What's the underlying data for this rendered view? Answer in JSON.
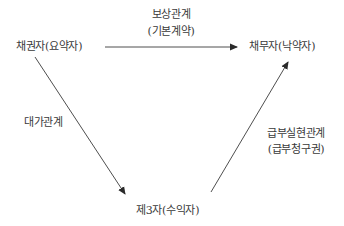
{
  "diagram": {
    "type": "flow-triangle",
    "nodes": {
      "creditor": {
        "label": "채권자(요약자)"
      },
      "debtor": {
        "label": "채무자(낙약자)"
      },
      "third_party": {
        "label": "제3자(수익자)"
      }
    },
    "edges": [
      {
        "id": "compensation",
        "from": "creditor",
        "to": "debtor",
        "label_line1": "보상관계",
        "label_line2": "(기본계약)",
        "arrow": "to"
      },
      {
        "id": "consideration",
        "from": "creditor",
        "to": "third_party",
        "label_line1": "대가관계",
        "arrow": "to"
      },
      {
        "id": "performance",
        "from": "third_party",
        "to": "debtor",
        "label_line1": "급부실현관계",
        "label_line2": "(급부청구권)",
        "arrow": "to"
      }
    ],
    "colors": {
      "line": "#3a3a3a",
      "text": "#3a3a3a"
    }
  }
}
